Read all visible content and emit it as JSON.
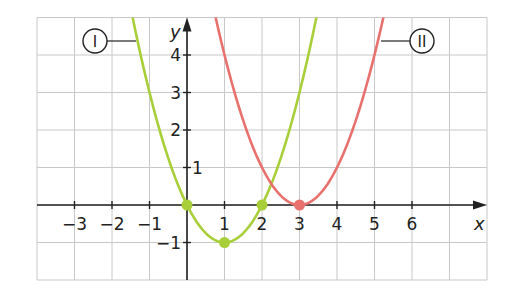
{
  "chart_data": {
    "type": "line",
    "title": "",
    "xlabel": "x",
    "ylabel": "y",
    "xlim": [
      -4,
      8
    ],
    "ylim": [
      -2,
      5
    ],
    "grid": true,
    "x_ticks": [
      -3,
      -2,
      -1,
      1,
      2,
      3,
      4,
      5,
      6
    ],
    "x_tick_labels": [
      "−3",
      "−2",
      "−1",
      "1",
      "2",
      "3",
      "4",
      "5",
      "6"
    ],
    "y_ticks": [
      4,
      3,
      2,
      1,
      -1
    ],
    "y_tick_labels": [
      "4",
      "3",
      "2",
      "1",
      "−1"
    ],
    "series": [
      {
        "name": "I",
        "label": "I",
        "color": "#a8cf3a",
        "formula": "y = (x-1)^2 - 1",
        "vertex": [
          1,
          -1
        ],
        "marked_points": [
          [
            0,
            0
          ],
          [
            1,
            -1
          ],
          [
            2,
            0
          ]
        ],
        "x": [
          -1.25,
          -1,
          -0.5,
          0,
          0.5,
          1,
          1.5,
          2,
          2.5,
          3,
          3.3
        ],
        "values": [
          4.06,
          3,
          1.25,
          0,
          -0.75,
          -1,
          -0.75,
          0,
          1.25,
          3,
          4.29
        ]
      },
      {
        "name": "II",
        "label": "II",
        "color": "#e8716e",
        "formula": "y = (x-3)^2",
        "vertex": [
          3,
          0
        ],
        "marked_points": [
          [
            3,
            0
          ]
        ],
        "x": [
          0.7,
          1,
          1.5,
          2,
          2.5,
          3,
          3.5,
          4,
          4.5,
          5,
          5.3
        ],
        "values": [
          5.29,
          4,
          2.25,
          1,
          0.25,
          0,
          0.25,
          1,
          2.25,
          4,
          5.29
        ]
      }
    ]
  },
  "labels": {
    "x_axis": "x",
    "y_axis": "y",
    "curve_1_badge": "I",
    "curve_2_badge": "II"
  }
}
